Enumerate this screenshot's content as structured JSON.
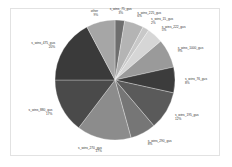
{
  "chart_data": {
    "type": "pie",
    "title": "",
    "start_angle_deg": 0,
    "direction": "clockwise",
    "slices": [
      {
        "label": "s_wins_75_gus",
        "value": 3,
        "pct_label": "3%",
        "color": "#6e6e6e"
      },
      {
        "label": "s_wins_225_gus",
        "value": 6,
        "pct_label": "6%",
        "color": "#b4b4b4"
      },
      {
        "label": "s_wins_15_gus",
        "value": 2,
        "pct_label": "2%",
        "color": "#c8c8c8"
      },
      {
        "label": "s_wins_222_gus",
        "value": 5,
        "pct_label": "5%",
        "color": "#d6d6d6"
      },
      {
        "label": "s_wins_1000_gus",
        "value": 9,
        "pct_label": "9%",
        "color": "#9a9a9a"
      },
      {
        "label": "s_wins_76_gus",
        "value": 8,
        "pct_label": "8%",
        "color": "#3c3c3c"
      },
      {
        "label": "s_wins_195_gus",
        "value": 12,
        "pct_label": "12%",
        "color": "#5a5a5a"
      },
      {
        "label": "s_wins_290_gus",
        "value": 8,
        "pct_label": "8%",
        "color": "#767676"
      },
      {
        "label": "s_wins_270_gus",
        "value": 17,
        "pct_label": "17%",
        "color": "#8c8c8c"
      },
      {
        "label": "s_wins_880_gus",
        "value": 17,
        "pct_label": "17%",
        "color": "#4a4a4a"
      },
      {
        "label": "s_wins_475_gus",
        "value": 20,
        "pct_label": "20%",
        "color": "#3a3a3a"
      },
      {
        "label": "other",
        "value": 9,
        "pct_label": "9%",
        "color": "#a6a6a6"
      }
    ],
    "legend": "none",
    "labels_outside": true
  },
  "geometry": {
    "cx": 115,
    "cy": 80,
    "r": 60,
    "label_r": 70
  }
}
